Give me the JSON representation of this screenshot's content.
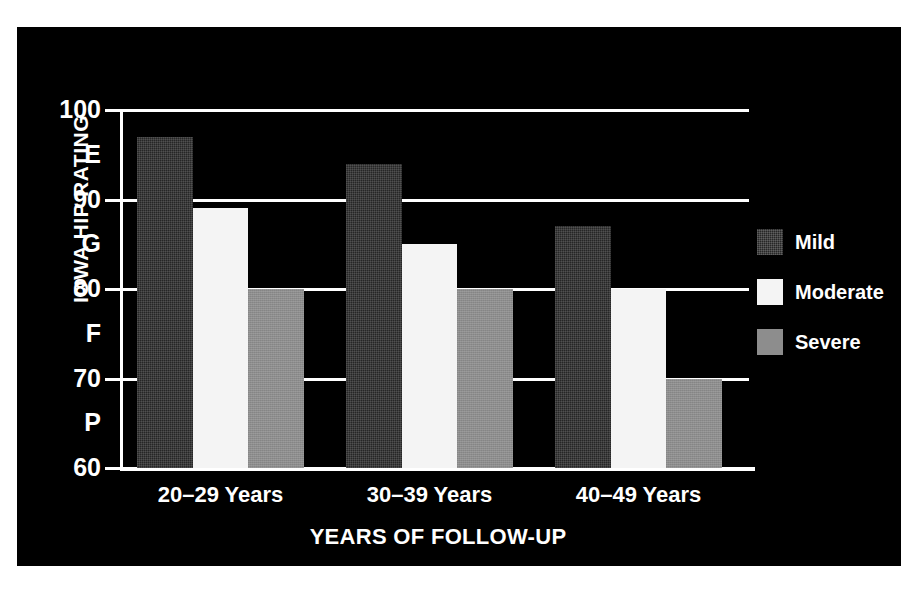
{
  "chart_data": {
    "type": "bar",
    "title": "",
    "xlabel": "YEARS OF FOLLOW-UP",
    "ylabel": "IOWA HIP RATING",
    "categories": [
      "20–29 Years",
      "30–39 Years",
      "40–49 Years"
    ],
    "series": [
      {
        "name": "Mild",
        "color": "#262626",
        "values": [
          97,
          94,
          87
        ]
      },
      {
        "name": "Moderate",
        "color": "#f4f4f4",
        "values": [
          89,
          85,
          80
        ]
      },
      {
        "name": "Severe",
        "color": "#8d8d8d",
        "values": [
          80,
          80,
          70
        ]
      }
    ],
    "ylim": [
      60,
      100
    ],
    "ytick_values": [
      100,
      90,
      80,
      70,
      60
    ],
    "ytick_labels": [
      "100",
      "90",
      "80",
      "70",
      "60"
    ],
    "y_grade_labels": [
      {
        "label": "E",
        "value": 95
      },
      {
        "label": "G",
        "value": 85
      },
      {
        "label": "F",
        "value": 75
      },
      {
        "label": "P",
        "value": 65
      }
    ],
    "grid": true,
    "legend_position": "right",
    "background": "#000000",
    "foreground": "#ffffff"
  },
  "legend": {
    "items": [
      {
        "label": "Mild"
      },
      {
        "label": "Moderate"
      },
      {
        "label": "Severe"
      }
    ]
  }
}
